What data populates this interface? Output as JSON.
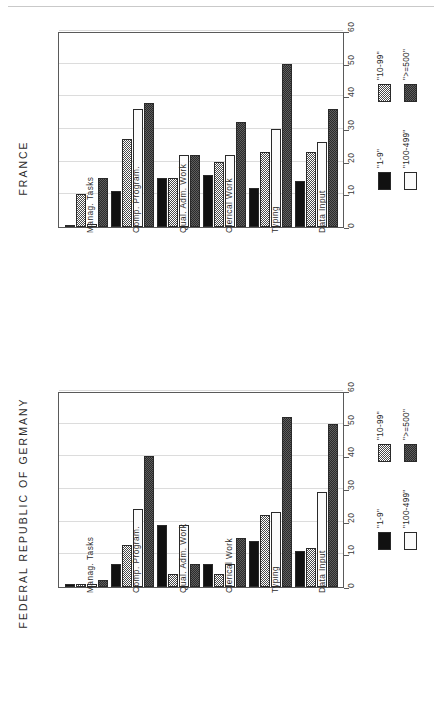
{
  "header": {
    "page_number": "164",
    "running_title": "THE DEMAND FOR 'ELECTRONIC OFFICE' WORKERS IN EUROPE"
  },
  "axis": {
    "ticks": [
      "0",
      "10",
      "20",
      "30",
      "40",
      "50",
      "60"
    ],
    "min": 0,
    "max": 60
  },
  "legend": {
    "entries": [
      {
        "label": "\"1-9\"",
        "swatch": "solid-black"
      },
      {
        "label": "\"10-99\"",
        "swatch": "light-checkered"
      },
      {
        "label": "\"100-499\"",
        "swatch": "white"
      },
      {
        "label": "\">=500\"",
        "swatch": "dark-checkered"
      }
    ]
  },
  "categories": [
    "Manag. Tasks",
    "Comp. Program.",
    "Qual. Adm. Work",
    "Clerical Work",
    "Typing",
    "Data Input"
  ],
  "charts": [
    {
      "id": "france",
      "title": "FRANCE"
    },
    {
      "id": "germany",
      "title": "FEDERAL REPUBLIC OF GERMANY"
    }
  ],
  "chart_data": [
    {
      "type": "bar",
      "title": "FRANCE",
      "xlabel": "",
      "ylabel": "",
      "ylim": [
        0,
        60
      ],
      "yticks": [
        0,
        10,
        20,
        30,
        40,
        50,
        60
      ],
      "grid": true,
      "legend_position": "right",
      "categories": [
        "Manag. Tasks",
        "Comp. Program.",
        "Qual. Adm. Work",
        "Clerical Work",
        "Typing",
        "Data Input"
      ],
      "series": [
        {
          "name": "\"1-9\"",
          "values": [
            0,
            11,
            15,
            16,
            12,
            14
          ]
        },
        {
          "name": "\"10-99\"",
          "values": [
            10,
            27,
            15,
            20,
            23,
            23
          ]
        },
        {
          "name": "\"100-499\"",
          "values": [
            1,
            36,
            22,
            22,
            30,
            26
          ]
        },
        {
          "name": "\">=500\"",
          "values": [
            15,
            38,
            22,
            32,
            50,
            36
          ]
        }
      ]
    },
    {
      "type": "bar",
      "title": "FEDERAL REPUBLIC OF GERMANY",
      "xlabel": "",
      "ylabel": "",
      "ylim": [
        0,
        60
      ],
      "yticks": [
        0,
        10,
        20,
        30,
        40,
        50,
        60
      ],
      "grid": true,
      "legend_position": "right",
      "categories": [
        "Manag. Tasks",
        "Comp. Program.",
        "Qual. Adm. Work",
        "Clerical Work",
        "Typing",
        "Data Input"
      ],
      "series": [
        {
          "name": "\"1-9\"",
          "values": [
            1,
            7,
            19,
            7,
            14,
            11
          ]
        },
        {
          "name": "\"10-99\"",
          "values": [
            1,
            13,
            4,
            4,
            22,
            12
          ]
        },
        {
          "name": "\"100-499\"",
          "values": [
            1,
            24,
            19,
            7,
            23,
            29
          ]
        },
        {
          "name": "\">=500\"",
          "values": [
            2,
            40,
            7,
            15,
            52,
            50
          ]
        }
      ]
    }
  ]
}
